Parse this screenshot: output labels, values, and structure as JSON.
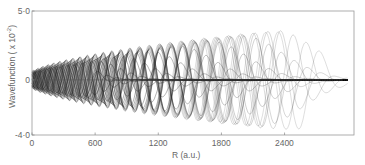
{
  "chart_data": {
    "type": "line",
    "title": "",
    "xlabel": "R (a.u.)",
    "ylabel": "Wavefunction (x 10^-2)",
    "ylabel_display": "Wavefunction  ( x 10",
    "ylabel_exp": "-2",
    "xlim": [
      0,
      3060
    ],
    "ylim": [
      -4.0,
      5.0
    ],
    "x_ticks": [
      0,
      600,
      1200,
      1800,
      2400
    ],
    "x_tick_labels": [
      "0",
      "600",
      "1200",
      "1800",
      "2400"
    ],
    "y_ticks": [
      5.0,
      0,
      -4.0
    ],
    "y_tick_labels": [
      "5·0",
      "0",
      "-4·0"
    ],
    "grid": false,
    "legend": null,
    "series_envelope": {
      "x": [
        0,
        200,
        400,
        600,
        900,
        1200,
        1500,
        1800,
        2100,
        2400,
        2800,
        3000
      ],
      "max_amplitude": [
        0.5,
        1.0,
        1.8,
        2.6,
        3.2,
        3.6,
        3.6,
        3.3,
        2.8,
        0.2,
        0.0,
        0.0
      ]
    },
    "curve_count": 40,
    "turning_point_range": [
      500,
      2500
    ]
  },
  "colors": {
    "axis": "#888888",
    "curve": "#222222"
  }
}
